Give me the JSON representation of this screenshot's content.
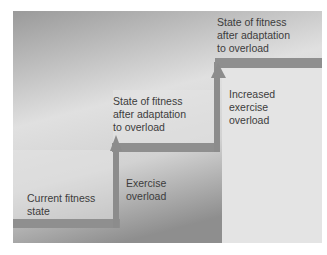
{
  "diagram": {
    "colors": {
      "background_top": "#9a9a9a",
      "background_mid": "#e2e2e2",
      "background_bottom": "#8e8e8e",
      "step_face": "#e6e6e6",
      "step_edge": "#8f8f8f",
      "arrow": "#8c8c8c",
      "text": "#3c3c3c"
    },
    "labels": {
      "current_state": [
        "Current fitness",
        "state"
      ],
      "exercise_overload": [
        "Exercise",
        "overload"
      ],
      "state_after_1": [
        "State of fitness",
        "after adaptation",
        "to overload"
      ],
      "increased_overload": [
        "Increased",
        "exercise",
        "overload"
      ],
      "state_after_2": [
        "State of fitness",
        "after adaptation",
        "to overload"
      ]
    }
  }
}
